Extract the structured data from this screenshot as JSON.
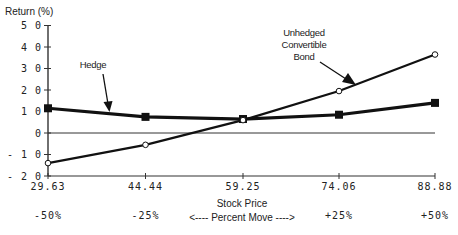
{
  "chart_data": {
    "type": "line",
    "title": "",
    "ylabel": "Return  (%)",
    "xlabel": "Stock Price",
    "x": [
      29.63,
      44.44,
      59.25,
      74.06,
      88.88
    ],
    "x_tick_labels": [
      "29.63",
      "44.44",
      "59.25",
      "74.06",
      "88.88"
    ],
    "percent_move_labels": [
      "-50%",
      "-25%",
      "+25%",
      "+50%"
    ],
    "percent_move_caption": "<---- Percent Move ---->",
    "ylim": [
      -20,
      50
    ],
    "y_ticks": [
      50,
      40,
      30,
      20,
      10,
      0,
      -10,
      -20
    ],
    "y_tick_labels": [
      "5 0",
      "4 0",
      "3 0",
      "2 0",
      "1 0",
      "0",
      "- 1 0",
      "- 2 0"
    ],
    "grid": false,
    "zero_line": true,
    "series": [
      {
        "name": "Hedge",
        "marker": "filled-square",
        "values": [
          11.5,
          7.5,
          6.5,
          8.5,
          14
        ]
      },
      {
        "name": "Unhedged Convertible Bond",
        "marker": "open-circle",
        "values": [
          -14,
          -5.5,
          6,
          19.5,
          36.5
        ]
      }
    ],
    "annotations": [
      {
        "text": "Hedge",
        "points_to_series": "Hedge"
      },
      {
        "text_lines": [
          "Unhedged",
          "Convertible",
          "Bond"
        ],
        "points_to_series": "Unhedged Convertible Bond"
      }
    ]
  }
}
